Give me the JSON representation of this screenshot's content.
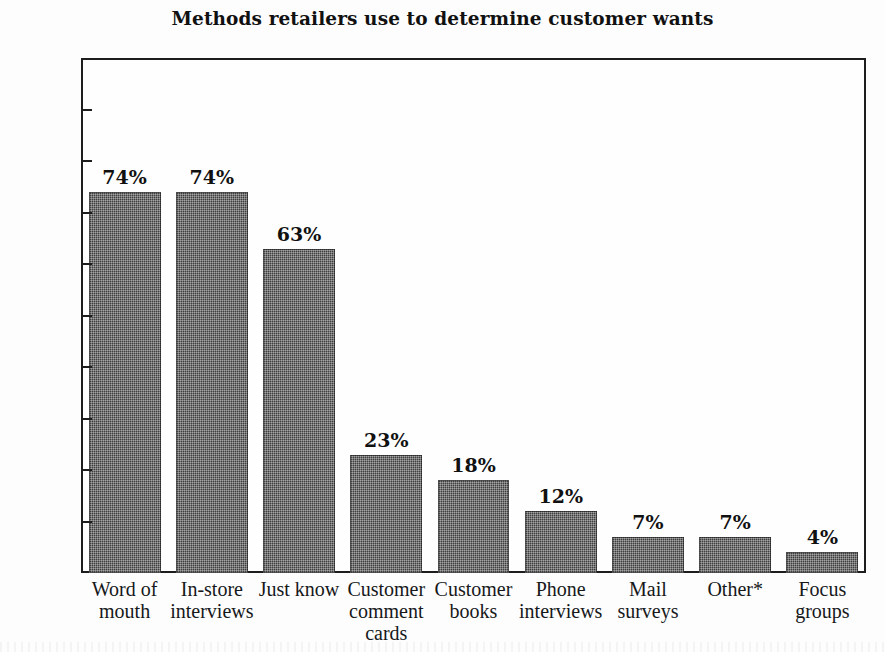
{
  "chart_data": {
    "type": "bar",
    "title": "Methods retailers use to determine customer wants",
    "xlabel": "",
    "ylabel": "",
    "ylim": [
      0,
      100
    ],
    "grid": false,
    "legend": null,
    "value_suffix": "%",
    "categories": [
      "Word of mouth",
      "In-store interviews",
      "Just know",
      "Customer comment cards",
      "Customer books",
      "Phone interviews",
      "Mail surveys",
      "Other*",
      "Focus groups"
    ],
    "category_lines": [
      [
        "Word of",
        "mouth"
      ],
      [
        "In-store",
        "interviews"
      ],
      [
        "Just know"
      ],
      [
        "Customer",
        "comment",
        "cards"
      ],
      [
        "Customer",
        "books"
      ],
      [
        "Phone",
        "interviews"
      ],
      [
        "Mail",
        "surveys"
      ],
      [
        "Other*"
      ],
      [
        "Focus",
        "groups"
      ]
    ],
    "values": [
      74,
      74,
      63,
      23,
      18,
      12,
      7,
      7,
      4
    ],
    "value_labels": [
      "74%",
      "74%",
      "63%",
      "23%",
      "18%",
      "12%",
      "7%",
      "7%",
      "4%"
    ],
    "yticks": [
      0,
      10,
      20,
      30,
      40,
      50,
      60,
      70,
      80,
      90,
      100
    ],
    "ytick_labels": [
      "0%",
      "10%",
      "20%",
      "30%",
      "40%",
      "50%",
      "60%",
      "70%",
      "80%",
      "90%",
      "100%"
    ],
    "colors": {
      "bar_fill": "#3e3e3e",
      "axis": "#1d1d1d",
      "text": "#16181a",
      "background": "#fdfdfd"
    }
  }
}
